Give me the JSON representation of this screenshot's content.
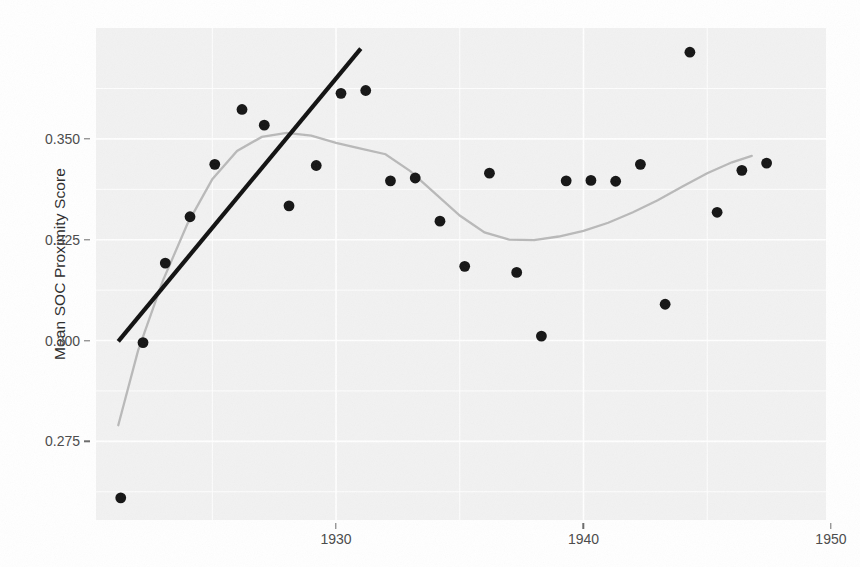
{
  "chart_data": {
    "type": "scatter",
    "title": "",
    "subtitle": "",
    "xlabel": "",
    "ylabel": "Mean SOC Proximity Score",
    "xlim": [
      1920.3,
      1949.8
    ],
    "ylim": [
      0.2555,
      0.3775
    ],
    "xticks": [
      1930,
      1940,
      1950
    ],
    "xtick_labels": [
      "1930",
      "1940",
      "1950"
    ],
    "yticks": [
      0.275,
      0.3,
      0.325,
      0.35
    ],
    "ytick_labels": [
      "0.275",
      "0.300",
      "0.325",
      "0.350"
    ],
    "grid": true,
    "legend": "none",
    "panel_background": "#f2f2f2",
    "point_color": "#141414",
    "trend_line_color": "#101010",
    "loess_line_color": "#b9b9b9",
    "series": [
      {
        "name": "Mean SOC Proximity Score",
        "type": "scatter",
        "points": [
          {
            "x": 1921.3,
            "y": 0.261
          },
          {
            "x": 1922.2,
            "y": 0.2995
          },
          {
            "x": 1923.1,
            "y": 0.3192
          },
          {
            "x": 1924.1,
            "y": 0.3307
          },
          {
            "x": 1925.1,
            "y": 0.3437
          },
          {
            "x": 1926.2,
            "y": 0.3573
          },
          {
            "x": 1927.1,
            "y": 0.3534
          },
          {
            "x": 1928.1,
            "y": 0.3334
          },
          {
            "x": 1929.2,
            "y": 0.3434
          },
          {
            "x": 1930.2,
            "y": 0.3613
          },
          {
            "x": 1931.2,
            "y": 0.362
          },
          {
            "x": 1932.2,
            "y": 0.3396
          },
          {
            "x": 1933.2,
            "y": 0.3403
          },
          {
            "x": 1934.2,
            "y": 0.3296
          },
          {
            "x": 1935.2,
            "y": 0.3184
          },
          {
            "x": 1936.2,
            "y": 0.3415
          },
          {
            "x": 1937.3,
            "y": 0.3169
          },
          {
            "x": 1938.3,
            "y": 0.3011
          },
          {
            "x": 1939.3,
            "y": 0.3396
          },
          {
            "x": 1940.3,
            "y": 0.3397
          },
          {
            "x": 1941.3,
            "y": 0.3395
          },
          {
            "x": 1942.3,
            "y": 0.3437
          },
          {
            "x": 1943.3,
            "y": 0.309
          },
          {
            "x": 1944.3,
            "y": 0.3715
          },
          {
            "x": 1945.4,
            "y": 0.3318
          },
          {
            "x": 1946.4,
            "y": 0.3422
          },
          {
            "x": 1947.4,
            "y": 0.344
          }
        ]
      },
      {
        "name": "Linear trend",
        "type": "line",
        "points": [
          {
            "x": 1921.2,
            "y": 0.2998
          },
          {
            "x": 1931.0,
            "y": 0.3724
          }
        ]
      },
      {
        "name": "LOESS smooth",
        "type": "line",
        "points": [
          {
            "x": 1921.2,
            "y": 0.279
          },
          {
            "x": 1922.0,
            "y": 0.2975
          },
          {
            "x": 1923.0,
            "y": 0.3148
          },
          {
            "x": 1924.0,
            "y": 0.329
          },
          {
            "x": 1925.0,
            "y": 0.34
          },
          {
            "x": 1926.0,
            "y": 0.347
          },
          {
            "x": 1927.0,
            "y": 0.3505
          },
          {
            "x": 1928.0,
            "y": 0.3515
          },
          {
            "x": 1929.0,
            "y": 0.3508
          },
          {
            "x": 1930.0,
            "y": 0.349
          },
          {
            "x": 1931.0,
            "y": 0.3476
          },
          {
            "x": 1932.0,
            "y": 0.3462
          },
          {
            "x": 1933.0,
            "y": 0.342
          },
          {
            "x": 1934.0,
            "y": 0.3365
          },
          {
            "x": 1935.0,
            "y": 0.331
          },
          {
            "x": 1936.0,
            "y": 0.3268
          },
          {
            "x": 1937.0,
            "y": 0.325
          },
          {
            "x": 1938.0,
            "y": 0.3249
          },
          {
            "x": 1939.0,
            "y": 0.3258
          },
          {
            "x": 1940.0,
            "y": 0.3272
          },
          {
            "x": 1941.0,
            "y": 0.3292
          },
          {
            "x": 1942.0,
            "y": 0.3318
          },
          {
            "x": 1943.0,
            "y": 0.3348
          },
          {
            "x": 1944.0,
            "y": 0.3382
          },
          {
            "x": 1945.0,
            "y": 0.3415
          },
          {
            "x": 1946.0,
            "y": 0.3442
          },
          {
            "x": 1946.8,
            "y": 0.3458
          }
        ]
      }
    ]
  }
}
